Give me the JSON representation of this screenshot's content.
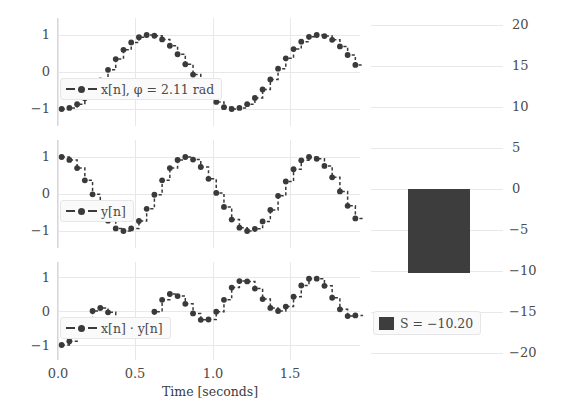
{
  "figure": {
    "bar_color": "#3d3d3d",
    "line_color": "#3a3a3a",
    "grid_color": "#e8e8ea"
  },
  "chart_data": [
    {
      "type": "line",
      "name": "x-signal",
      "title": "",
      "xlabel": "",
      "ylabel": "",
      "grid": true,
      "drawstyle": "steps-post",
      "legend_position": "lower left",
      "legend": [
        "x[n], φ = 2.11 rad"
      ],
      "xlim": [
        -0.03,
        1.93
      ],
      "ylim": [
        -1.35,
        1.35
      ],
      "xticks": [
        0.0,
        0.5,
        1.0,
        1.5
      ],
      "yticks": [
        -1,
        0,
        1
      ],
      "ytick_labels": [
        "−1",
        "0",
        "1"
      ],
      "x": [
        0.0,
        0.05,
        0.1,
        0.15,
        0.2,
        0.25,
        0.3,
        0.35,
        0.4,
        0.45,
        0.5,
        0.55,
        0.6,
        0.65,
        0.7,
        0.75,
        0.8,
        0.85,
        0.9,
        0.95,
        1.0,
        1.05,
        1.1,
        1.15,
        1.2,
        1.25,
        1.3,
        1.35,
        1.4,
        1.45,
        1.5,
        1.55,
        1.6,
        1.65,
        1.7,
        1.75,
        1.8,
        1.85,
        1.9
      ],
      "values": [
        -1.0,
        -0.97,
        -0.87,
        -0.71,
        -0.49,
        -0.23,
        0.06,
        0.35,
        0.6,
        0.8,
        0.94,
        1.0,
        0.98,
        0.88,
        0.71,
        0.48,
        0.21,
        -0.07,
        -0.35,
        -0.61,
        -0.81,
        -0.95,
        -1.0,
        -0.97,
        -0.87,
        -0.7,
        -0.47,
        -0.2,
        0.09,
        0.37,
        0.62,
        0.82,
        0.95,
        1.0,
        0.97,
        0.87,
        0.69,
        0.46,
        0.19
      ]
    },
    {
      "type": "line",
      "name": "y-signal",
      "title": "",
      "xlabel": "",
      "ylabel": "",
      "grid": true,
      "drawstyle": "steps-post",
      "legend_position": "lower left",
      "legend": [
        "y[n]"
      ],
      "xlim": [
        -0.03,
        1.93
      ],
      "ylim": [
        -1.35,
        1.35
      ],
      "xticks": [
        0.0,
        0.5,
        1.0,
        1.5
      ],
      "yticks": [
        -1,
        0,
        1
      ],
      "ytick_labels": [
        "−1",
        "0",
        "1"
      ],
      "x": [
        0.0,
        0.05,
        0.1,
        0.15,
        0.2,
        0.25,
        0.3,
        0.35,
        0.4,
        0.45,
        0.5,
        0.55,
        0.6,
        0.65,
        0.7,
        0.75,
        0.8,
        0.85,
        0.9,
        0.95,
        1.0,
        1.05,
        1.1,
        1.15,
        1.2,
        1.25,
        1.3,
        1.35,
        1.4,
        1.45,
        1.5,
        1.55,
        1.6,
        1.65,
        1.7,
        1.75,
        1.8,
        1.85,
        1.9
      ],
      "values": [
        1.0,
        0.92,
        0.7,
        0.37,
        -0.01,
        -0.4,
        -0.72,
        -0.93,
        -1.0,
        -0.93,
        -0.73,
        -0.4,
        -0.02,
        0.37,
        0.7,
        0.92,
        1.0,
        0.93,
        0.73,
        0.41,
        0.03,
        -0.35,
        -0.69,
        -0.91,
        -1.0,
        -0.94,
        -0.74,
        -0.43,
        -0.05,
        0.34,
        0.67,
        0.91,
        1.0,
        0.95,
        0.76,
        0.45,
        0.07,
        -0.32,
        -0.66
      ]
    },
    {
      "type": "line",
      "name": "product-signal",
      "title": "",
      "xlabel": "Time [seconds]",
      "ylabel": "",
      "grid": true,
      "drawstyle": "steps-post",
      "legend_position": "lower left",
      "legend": [
        "x[n] · y[n]"
      ],
      "xlim": [
        -0.03,
        1.93
      ],
      "ylim": [
        -1.35,
        1.35
      ],
      "xticks": [
        0.0,
        0.5,
        1.0,
        1.5
      ],
      "xtick_labels": [
        "0.0",
        "0.5",
        "1.0",
        "1.5"
      ],
      "yticks": [
        -1,
        0,
        1
      ],
      "ytick_labels": [
        "−1",
        "0",
        "1"
      ],
      "x": [
        0.0,
        0.05,
        0.1,
        0.15,
        0.2,
        0.25,
        0.3,
        0.35,
        0.4,
        0.45,
        0.5,
        0.55,
        0.6,
        0.65,
        0.7,
        0.75,
        0.8,
        0.85,
        0.9,
        0.95,
        1.0,
        1.05,
        1.1,
        1.15,
        1.2,
        1.25,
        1.3,
        1.35,
        1.4,
        1.45,
        1.5,
        1.55,
        1.6,
        1.65,
        1.7,
        1.75,
        1.8,
        1.85,
        1.9
      ],
      "values": [
        -1.0,
        -0.89,
        -0.61,
        -0.26,
        0.0,
        0.09,
        -0.04,
        -0.33,
        -0.6,
        -0.74,
        -0.69,
        -0.4,
        -0.02,
        0.33,
        0.5,
        0.44,
        0.21,
        -0.07,
        -0.26,
        -0.25,
        -0.02,
        0.33,
        0.69,
        0.88,
        0.87,
        0.66,
        0.35,
        0.09,
        0.0,
        0.13,
        0.42,
        0.75,
        0.95,
        0.95,
        0.74,
        0.39,
        0.05,
        -0.15,
        -0.13
      ]
    },
    {
      "type": "bar",
      "name": "sum-bar",
      "title": "",
      "xlabel": "",
      "ylabel": "",
      "grid": true,
      "legend_position": "lower left",
      "legend": [
        "S = −10.20"
      ],
      "categories": [
        "S"
      ],
      "values": [
        -10.2
      ],
      "ylim": [
        -22.0,
        22.0
      ],
      "yticks": [
        -20,
        -15,
        -10,
        -5,
        0,
        5,
        10,
        15,
        20
      ],
      "ytick_labels": [
        "−20",
        "−15",
        "−10",
        "−5",
        "0",
        "5",
        "10",
        "15",
        "20"
      ]
    }
  ]
}
